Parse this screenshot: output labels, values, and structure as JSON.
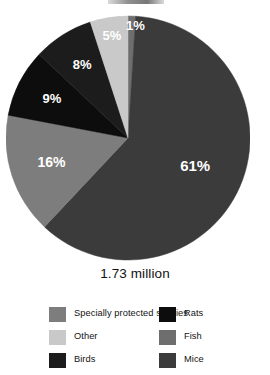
{
  "caption": "1.73 million",
  "chart_data": {
    "type": "pie",
    "title": "",
    "subtitle": "",
    "xlabel": "",
    "ylabel": "",
    "total_label": "1.73 million",
    "start_angle_deg": 0,
    "direction": "clockwise",
    "legend_position": "bottom",
    "grid": false,
    "categories": [
      "Fish",
      "Mice",
      "Specially protected species",
      "Rats",
      "Birds",
      "Other"
    ],
    "values": [
      1,
      61,
      16,
      9,
      8,
      5
    ],
    "value_labels": [
      "1%",
      "61%",
      "16%",
      "9%",
      "8%",
      "5%"
    ],
    "colors": [
      "#6e6e6e",
      "#3b3b3b",
      "#7d7d7d",
      "#0d0d0d",
      "#1c1c1c",
      "#c9c9c9"
    ],
    "slices": [
      {
        "label": "Fish",
        "value": 1,
        "display": "1%",
        "color": "#6e6e6e"
      },
      {
        "label": "Mice",
        "value": 61,
        "display": "61%",
        "color": "#3b3b3b"
      },
      {
        "label": "Specially protected species",
        "value": 16,
        "display": "16%",
        "color": "#7d7d7d"
      },
      {
        "label": "Rats",
        "value": 9,
        "display": "9%",
        "color": "#0d0d0d"
      },
      {
        "label": "Birds",
        "value": 8,
        "display": "8%",
        "color": "#1c1c1c"
      },
      {
        "label": "Other",
        "value": 5,
        "display": "5%",
        "color": "#c9c9c9"
      }
    ]
  },
  "legend": {
    "left_column": [
      {
        "label": "Specially protected species",
        "color": "#7d7d7d"
      },
      {
        "label": "Other",
        "color": "#c9c9c9"
      },
      {
        "label": "Birds",
        "color": "#1c1c1c"
      }
    ],
    "right_column": [
      {
        "label": "Rats",
        "color": "#0d0d0d"
      },
      {
        "label": "Fish",
        "color": "#6e6e6e"
      },
      {
        "label": "Mice",
        "color": "#3b3b3b"
      }
    ]
  }
}
